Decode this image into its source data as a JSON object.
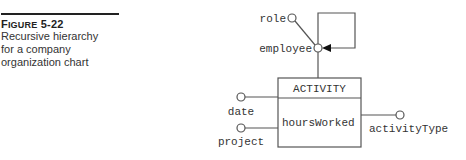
{
  "caption": {
    "label_prefix": "F",
    "label_smallcaps": "IGURE",
    "number": "5-22",
    "text_lines": [
      "Recursive hierarchy",
      "for a company",
      "organization chart"
    ]
  },
  "diagram": {
    "entity": {
      "name": "ACTIVITY",
      "attributes": [
        "hoursWorked"
      ]
    },
    "nodes": {
      "role": "role",
      "employee": "employee",
      "date": "date",
      "project": "project",
      "activityType": "activityType"
    },
    "colors": {
      "line": "#555555",
      "text": "#333333",
      "arrow": "#111111"
    }
  }
}
